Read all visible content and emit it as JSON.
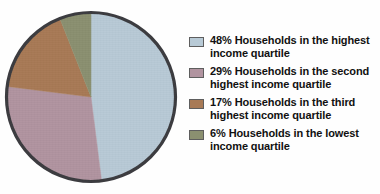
{
  "chart_data": {
    "type": "pie",
    "title": "",
    "subtitle": "",
    "xlabel": "",
    "ylabel": "",
    "legend_position": "right",
    "grid": false,
    "start_angle_deg": 0,
    "direction": "clockwise",
    "categories": [
      "Households in the highest income quartile",
      "Households in the second highest income quartile",
      "Households in the third highest income quartile",
      "Households in the lowest income quartile"
    ],
    "values": [
      48,
      29,
      17,
      6
    ],
    "value_unit": "%",
    "colors": [
      "#b8cad6",
      "#b194a0",
      "#a87a56",
      "#8b9070"
    ],
    "slices": [
      {
        "label": "Households in the highest income quartile",
        "value": 48,
        "percent_text": "48%",
        "color": "#b8cad6",
        "legend_text": "48% Households in the highest\nincome quartile"
      },
      {
        "label": "Households in the second highest income quartile",
        "value": 29,
        "percent_text": "29%",
        "color": "#b194a0",
        "legend_text": "29% Households in the second\nhighest income quartile"
      },
      {
        "label": "Households in the third highest income quartile",
        "value": 17,
        "percent_text": "17%",
        "color": "#a87a56",
        "legend_text": "17% Households in the third\nhighest income quartile"
      },
      {
        "label": "Households in the lowest income quartile",
        "value": 6,
        "percent_text": "6%",
        "color": "#8b9070",
        "legend_text": "6% Households in the lowest\nincome quartile"
      }
    ]
  },
  "style": {
    "background": "#fefefe",
    "outline_color": "#3c3c40",
    "swatch_border": "#5e5e5e",
    "text_color": "#111111"
  }
}
